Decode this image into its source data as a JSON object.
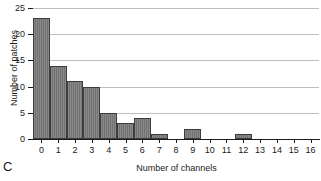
{
  "panel": {
    "letter": "C"
  },
  "chart_data": {
    "type": "bar",
    "title": "",
    "xlabel": "Number of channels",
    "ylabel": "Number of patches",
    "categories": [
      "0",
      "1",
      "2",
      "3",
      "4",
      "5",
      "6",
      "7",
      "8",
      "9",
      "10",
      "11",
      "12",
      "13",
      "14",
      "15",
      "16"
    ],
    "values": [
      23,
      14,
      11,
      10,
      5,
      3,
      4,
      1,
      0,
      2,
      0,
      0,
      1,
      0,
      0,
      0,
      0
    ],
    "xlim": [
      -0.5,
      16.5
    ],
    "ylim": [
      0,
      25
    ],
    "yticks": [
      0,
      5,
      10,
      15,
      20,
      25
    ],
    "xticks": [
      "0",
      "1",
      "2",
      "3",
      "4",
      "5",
      "6",
      "7",
      "8",
      "9",
      "10",
      "11",
      "12",
      "13",
      "14",
      "15",
      "16"
    ],
    "grid": "horizontal",
    "legend": "none",
    "bar_color": "#787878",
    "bar_edge_color": "#3d3d3d",
    "grid_color": "#bfbfbf",
    "axis_color": "#1a1a1a",
    "background": "#ffffff"
  }
}
